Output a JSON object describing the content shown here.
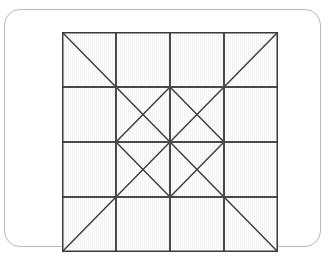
{
  "page": {
    "background_color": "#ffffff"
  },
  "card": {
    "name": "pattern-card",
    "background_color": "#ffffff",
    "border_color": "#b9b9b9",
    "corner_radius": 16
  },
  "palette": {
    "light": "#d5d5d5",
    "medium": "#8e8e8e",
    "dark": "#555555",
    "outline": "#3a3a3a",
    "grid_line": "#4a4a4a"
  },
  "diagram": {
    "name": "quilt-block-diagram",
    "type": "quilt-block",
    "grid_columns": 4,
    "grid_rows": 4,
    "cell_size": 54,
    "origin_x": 57,
    "origin_y": 22,
    "width": 216,
    "height": 220,
    "symmetry": "vertical-and-horizontal-mirror",
    "cells": [
      {
        "row": 0,
        "col": 0,
        "unit": "half-square-triangle",
        "split": "tl-br",
        "colors": [
          "light",
          "medium"
        ]
      },
      {
        "row": 0,
        "col": 1,
        "unit": "plain-square",
        "colors": [
          "medium"
        ]
      },
      {
        "row": 0,
        "col": 2,
        "unit": "plain-square",
        "colors": [
          "medium"
        ]
      },
      {
        "row": 0,
        "col": 3,
        "unit": "half-square-triangle",
        "split": "tr-bl",
        "colors": [
          "medium",
          "light"
        ]
      },
      {
        "row": 1,
        "col": 0,
        "unit": "plain-square",
        "colors": [
          "light"
        ]
      },
      {
        "row": 1,
        "col": 1,
        "unit": "quarter-square-triangle",
        "colors": [
          "light",
          "medium",
          "light",
          "dark"
        ]
      },
      {
        "row": 1,
        "col": 2,
        "unit": "quarter-square-triangle",
        "colors": [
          "medium",
          "light",
          "dark",
          "light"
        ]
      },
      {
        "row": 1,
        "col": 3,
        "unit": "plain-square",
        "colors": [
          "light"
        ]
      },
      {
        "row": 2,
        "col": 0,
        "unit": "plain-square",
        "colors": [
          "light"
        ]
      },
      {
        "row": 2,
        "col": 1,
        "unit": "quarter-square-triangle",
        "colors": [
          "dark",
          "light",
          "light",
          "medium"
        ]
      },
      {
        "row": 2,
        "col": 2,
        "unit": "quarter-square-triangle",
        "colors": [
          "light",
          "dark",
          "medium",
          "light"
        ]
      },
      {
        "row": 2,
        "col": 3,
        "unit": "plain-square",
        "colors": [
          "light"
        ]
      },
      {
        "row": 3,
        "col": 0,
        "unit": "half-square-triangle",
        "split": "tr-bl",
        "colors": [
          "medium",
          "light"
        ]
      },
      {
        "row": 3,
        "col": 1,
        "unit": "plain-square",
        "colors": [
          "medium"
        ]
      },
      {
        "row": 3,
        "col": 2,
        "unit": "plain-square",
        "colors": [
          "medium"
        ]
      },
      {
        "row": 3,
        "col": 3,
        "unit": "half-square-triangle",
        "split": "tl-br",
        "colors": [
          "light",
          "medium"
        ]
      }
    ]
  }
}
